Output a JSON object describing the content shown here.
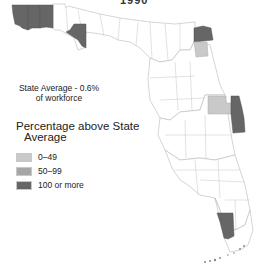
{
  "title": "1990",
  "state_average": {
    "line1": "State Average - 0.6%",
    "line2": "of workforce"
  },
  "legend": {
    "title_line1": "Percentage above State",
    "title_line2": "Average",
    "items": [
      {
        "label": "0–49",
        "color": "#c9c9c9"
      },
      {
        "label": "50–99",
        "color": "#a6a6a6"
      },
      {
        "label": "100 or more",
        "color": "#666666"
      }
    ]
  },
  "colors": {
    "none": "#ffffff",
    "low": "#c9c9c9",
    "mid": "#a6a6a6",
    "high": "#666666",
    "border": "#b8b8b8"
  },
  "map": {
    "region": "Florida counties",
    "highlighted_counties": [
      {
        "area": "western panhandle (far west)",
        "category": "100 or more"
      },
      {
        "area": "western panhandle (second)",
        "category": "100 or more"
      },
      {
        "area": "western panhandle (third)",
        "category": "100 or more"
      },
      {
        "area": "Bay area panhandle",
        "category": "100 or more"
      },
      {
        "area": "northeast (Duval area)",
        "category": "100 or more"
      },
      {
        "area": "northeast (Clay area)",
        "category": "0-49"
      },
      {
        "area": "east central (Orange area)",
        "category": "0-49"
      },
      {
        "area": "east central coast (Brevard area)",
        "category": "100 or more"
      },
      {
        "area": "southwest (Monroe mainland area)",
        "category": "100 or more"
      }
    ]
  }
}
